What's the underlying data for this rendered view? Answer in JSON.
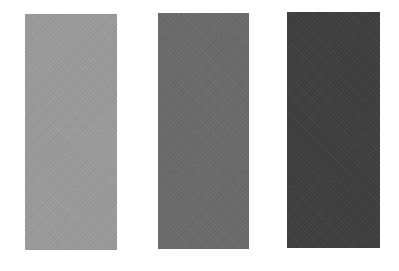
{
  "swatches": [
    {
      "name": "light-gray",
      "color": "#9a9a9a"
    },
    {
      "name": "medium-gray",
      "color": "#6a6a6a"
    },
    {
      "name": "dark-gray",
      "color": "#3e3e3e"
    }
  ],
  "background": "#ffffff"
}
